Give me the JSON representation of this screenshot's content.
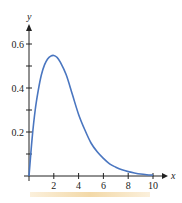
{
  "chart_data": {
    "type": "line",
    "title": "",
    "xlabel": "x",
    "ylabel": "y",
    "xlim": [
      0,
      10
    ],
    "ylim": [
      0,
      0.6
    ],
    "x_ticks": [
      2,
      4,
      6,
      8,
      10
    ],
    "x_tick_labels": [
      "2",
      "4",
      "6",
      "8",
      "10"
    ],
    "y_ticks": [
      0.1,
      0.2,
      0.3,
      0.4,
      0.5,
      0.6
    ],
    "y_tick_labels": [
      "0.2",
      "0.4",
      "0.6"
    ],
    "grid": false,
    "legend": null,
    "series": [
      {
        "name": "curve",
        "color": "#4a76c0",
        "x": [
          0,
          0.25,
          0.5,
          0.75,
          1,
          1.25,
          1.5,
          1.75,
          2,
          2.25,
          2.5,
          3,
          3.5,
          4,
          4.5,
          5,
          5.5,
          6,
          6.5,
          7,
          7.5,
          8,
          8.5,
          9,
          9.5,
          10
        ],
        "values": [
          0,
          0.17,
          0.3,
          0.39,
          0.46,
          0.505,
          0.532,
          0.545,
          0.548,
          0.54,
          0.52,
          0.46,
          0.37,
          0.28,
          0.21,
          0.15,
          0.11,
          0.08,
          0.055,
          0.04,
          0.028,
          0.02,
          0.014,
          0.009,
          0.006,
          0.004
        ]
      }
    ]
  }
}
